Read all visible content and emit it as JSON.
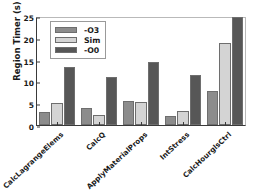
{
  "chart_data": {
    "type": "bar",
    "title": "",
    "xlabel": "",
    "ylabel": "Region Timer (s)",
    "categories": [
      "CalcLagrangeElems",
      "CalcQ",
      "ApplyMaterialProps",
      "IntStress",
      "CalcHourglsCtrl"
    ],
    "series": [
      {
        "name": "-O3",
        "color": "#8c8c8c",
        "values": [
          2.9,
          3.8,
          5.6,
          2.0,
          7.8
        ]
      },
      {
        "name": "Sim",
        "color": "#d4d4d4",
        "values": [
          5.1,
          2.4,
          5.2,
          3.1,
          18.8
        ]
      },
      {
        "name": "-O0",
        "color": "#575757",
        "values": [
          13.4,
          11.1,
          14.5,
          11.4,
          24.7
        ]
      }
    ],
    "ylim": [
      0,
      25
    ],
    "yticks": [
      0,
      5,
      10,
      15,
      20,
      25
    ],
    "ytick_labels": [
      "0",
      "5",
      "10",
      "15",
      "20",
      "25"
    ],
    "grid": false,
    "legend_position": "upper-left",
    "legend_entries": [
      "-O3",
      "Sim",
      "-O0"
    ]
  },
  "axes": {
    "ylabel": "Region Timer (s)"
  }
}
